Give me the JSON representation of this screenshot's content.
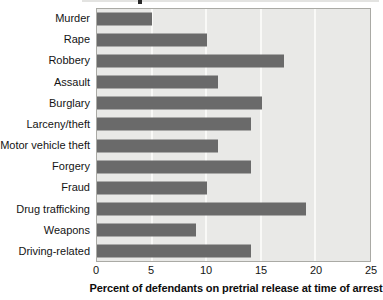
{
  "chart_data": {
    "type": "bar",
    "orientation": "horizontal",
    "categories": [
      "Murder",
      "Rape",
      "Robbery",
      "Assault",
      "Burglary",
      "Larceny/theft",
      "Motor vehicle theft",
      "Forgery",
      "Fraud",
      "Drug trafficking",
      "Weapons",
      "Driving-related"
    ],
    "values": [
      5,
      10,
      17,
      11,
      15,
      14,
      11,
      14,
      10,
      19,
      9,
      14
    ],
    "xlabel": "Percent of defendants on pretrial release at time of arrest",
    "ylabel": "",
    "xlim": [
      0,
      25
    ],
    "xticks": [
      0,
      5,
      10,
      15,
      20,
      25
    ],
    "grid": "vertical-white-gridlines",
    "legend": "none",
    "colors": {
      "bar": "#6a6a6a",
      "plot_background": "#e9e9e7",
      "gridline": "#f9f9f7",
      "plot_border": "#aaaaa5",
      "text": "#141414"
    }
  }
}
